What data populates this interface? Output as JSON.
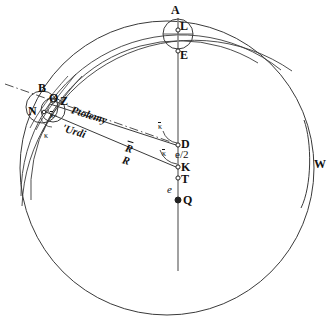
{
  "figure": {
    "stroke_color": "#333333",
    "axis_color": "#777777",
    "text_color": "#111111",
    "background": "#ffffff",
    "width": 335,
    "height": 323
  },
  "points": [
    {
      "id": "A",
      "label": "A",
      "x": 176,
      "y": 10
    },
    {
      "id": "L",
      "label": "L",
      "x": 180,
      "y": 25
    },
    {
      "id": "E",
      "label": "E",
      "x": 180,
      "y": 52
    },
    {
      "id": "B",
      "label": "B",
      "x": 39,
      "y": 84
    },
    {
      "id": "O",
      "label": "O",
      "x": 54,
      "y": 95
    },
    {
      "id": "Z",
      "label": "Z",
      "x": 64,
      "y": 98
    },
    {
      "id": "N",
      "label": "N",
      "x": 31,
      "y": 108
    },
    {
      "id": "D",
      "label": "D",
      "x": 180,
      "y": 139
    },
    {
      "id": "K",
      "label": "K",
      "x": 180,
      "y": 166
    },
    {
      "id": "T",
      "label": "T",
      "x": 180,
      "y": 178
    },
    {
      "id": "Q",
      "label": "Q",
      "x": 183,
      "y": 198
    },
    {
      "id": "W",
      "label": "W",
      "x": 315,
      "y": 164
    }
  ],
  "annotations": {
    "model_ptolemy": "Ptolemy",
    "model_urdi": "'Urdi",
    "radius_mean": "R",
    "radius": "R",
    "kappa_left_upper": "κ",
    "kappa_left_lower": "κ",
    "kappa_bar_upper": "κ",
    "kappa_bar_lower": "κ",
    "eccentricity_half": "e/2",
    "eccentricity": "e"
  },
  "annotation_positions": {
    "model_ptolemy": {
      "x": 70,
      "y": 113
    },
    "model_urdi": {
      "x": 62,
      "y": 131
    },
    "radius_mean": {
      "x": 125,
      "y": 151
    },
    "radius": {
      "x": 122,
      "y": 163
    },
    "kappa_left_upper": {
      "x": 50,
      "y": 116
    },
    "kappa_left_lower": {
      "x": 45,
      "y": 136
    },
    "kappa_bar_upper": {
      "x": 160,
      "y": 128
    },
    "kappa_bar_lower": {
      "x": 163,
      "y": 155
    },
    "eccentricity_half": {
      "x": 175,
      "y": 153
    },
    "eccentricity": {
      "x": 166,
      "y": 188
    }
  },
  "geometry": {
    "main_circle": {
      "cx": 167,
      "cy": 168,
      "r": 147
    },
    "arc_outer": {
      "cx": 178,
      "cy": 186,
      "r": 172
    },
    "arc_middle": {
      "cx": 178,
      "cy": 180,
      "r": 160
    },
    "arc_inner": {
      "cx": 178,
      "cy": 174,
      "r": 149
    },
    "epicycle_top": {
      "cx": 178,
      "cy": 34,
      "r": 15
    },
    "epicycle_left_outer": {
      "cx": 42,
      "cy": 106,
      "r": 16
    },
    "epicycle_left_inner": {
      "cx": 52,
      "cy": 110,
      "r": 12
    },
    "vertical_axis": {
      "x": 178,
      "y1": 18,
      "y2": 271
    },
    "dashdot_line": {
      "x1": 5,
      "y1": 84,
      "x2": 168,
      "y2": 141
    }
  }
}
